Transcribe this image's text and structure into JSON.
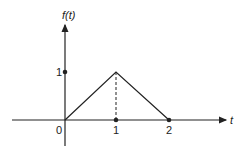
{
  "diagram": {
    "type": "function-plot",
    "y_axis_label": "f(t)",
    "x_axis_label": "t",
    "x_tick_labels": [
      "0",
      "1",
      "2"
    ],
    "y_tick_labels": [
      "1"
    ],
    "function_points": [
      [
        0,
        0
      ],
      [
        1,
        1
      ],
      [
        2,
        0
      ]
    ],
    "dashed_guide": {
      "from": [
        1,
        0
      ],
      "to": [
        1,
        1
      ]
    },
    "colors": {
      "line": "#222222",
      "background": "#ffffff"
    }
  }
}
